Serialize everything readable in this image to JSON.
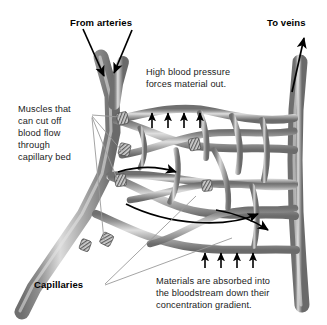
{
  "figure": {
    "title_alt": "Capillary bed diagram",
    "labels": {
      "from_arteries": "From arteries",
      "to_veins": "To veins",
      "capillaries": "Capillaries",
      "high_pressure_l1": "High blood pressure",
      "high_pressure_l2": "forces material out.",
      "muscles_l1": "Muscles that",
      "muscles_l2": "can cut off",
      "muscles_l3": "blood flow",
      "muscles_l4": "through",
      "muscles_l5": "capillary bed",
      "absorbed_l1": "Materials are absorbed into",
      "absorbed_l2": "the bloodstream down their",
      "absorbed_l3": "concentration gradient."
    },
    "colors": {
      "vessel_dark": "#6e6e6e",
      "vessel_mid": "#9a9a9a",
      "vessel_light": "#d8d8d8",
      "arrow": "#000000",
      "leader": "#8c8c8c",
      "text": "#000000",
      "background": "#ffffff"
    },
    "arrow_groups": {
      "filtration_out_count": 4,
      "absorption_in_count": 4,
      "artery_inflow_count": 2,
      "vein_outflow_count": 1,
      "flow_direction_count": 2
    }
  }
}
